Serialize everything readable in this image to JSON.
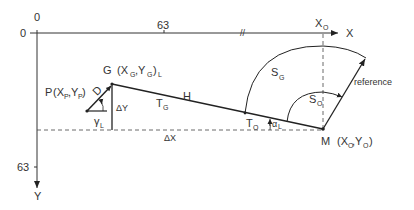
{
  "axes": {
    "origin_x_label": "0",
    "origin_y_label": "0",
    "x_tick_label": "63",
    "y_tick_label": "63",
    "x_axis_label": "X",
    "y_axis_label": "Y",
    "xo_label": "X",
    "xo_sub": "O"
  },
  "points": {
    "G": {
      "name": "G",
      "coord": "(X",
      "sub1": "G",
      "sep": ",Y",
      "sub2": "G",
      "close": ")",
      "subL": "L"
    },
    "P": {
      "name": "P",
      "coord": "(X",
      "sub1": "P",
      "sep": ",Y",
      "sub2": "P",
      "close": ")"
    },
    "M": {
      "name": "M",
      "coord": "(X",
      "sub1": "O",
      "sep": " ,Y",
      "sub2": "O",
      "close": ")"
    }
  },
  "labels": {
    "D": "D",
    "gammaL": "γ",
    "gammaL_sub": "L",
    "deltaY": "ΔY",
    "deltaX": "ΔX",
    "T": "T",
    "TG_sub": "G",
    "H": "H",
    "TO_sub": "O",
    "alpha": "α",
    "alpha_sub": "L",
    "S": "S",
    "SG_sub": "G",
    "SO_sub": "O",
    "reference": "reference"
  }
}
